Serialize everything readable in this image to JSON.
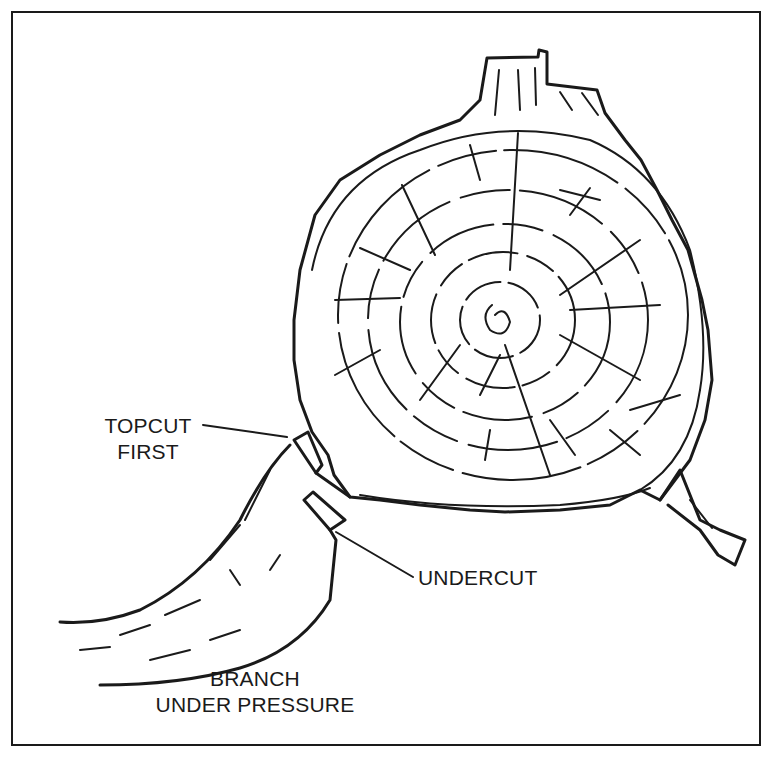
{
  "figure": {
    "labels": {
      "topcut_line1": "TOPCUT",
      "topcut_line2": "FIRST",
      "undercut": "UNDERCUT",
      "branch_line1": "BRANCH",
      "branch_line2": "UNDER PRESSURE"
    },
    "colors": {
      "ink": "#1a1a1a",
      "background": "#ffffff"
    }
  }
}
